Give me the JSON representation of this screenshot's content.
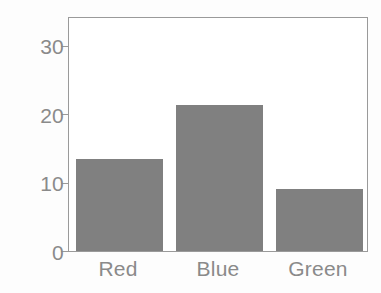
{
  "chart_data": {
    "type": "bar",
    "title": "",
    "subtitle": "",
    "xlabel": "",
    "ylabel": "",
    "categories": [
      "Red",
      "Blue",
      "Green"
    ],
    "values": [
      13.4,
      21.3,
      9.0
    ],
    "series": [
      {
        "name": "counts",
        "values": [
          13.4,
          21.3,
          9.0
        ]
      }
    ],
    "ylim": [
      0,
      34.3
    ],
    "xlim": [
      0,
      3
    ],
    "y_ticks": [
      0,
      10,
      20,
      30
    ],
    "y_tick_labels": [
      "0",
      "10",
      "20",
      "30"
    ],
    "x_tick_labels": [
      "Red",
      "Blue",
      "Green"
    ],
    "grid": false,
    "legend": null,
    "legend_position": "none",
    "annotations": [],
    "bar_color": "#808080",
    "bar_width_fraction": 0.87,
    "frame_color": "#9a9a9a",
    "tick_label_color": "#8a8a8a",
    "background_color": "#ffffff",
    "figure_background_color": "#fdfdfd"
  }
}
